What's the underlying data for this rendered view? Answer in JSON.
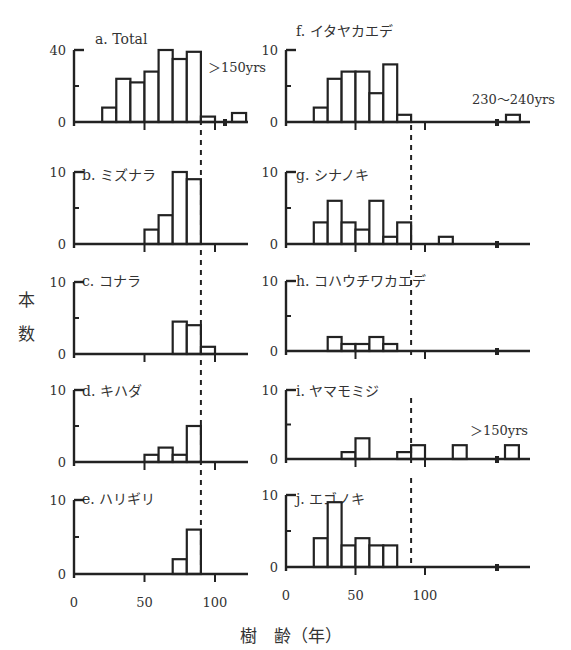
{
  "chart_data": {
    "type": "bar",
    "xlabel": "樹 齢（年）",
    "ylabel": "本 数",
    "bin_width": 10,
    "x_ticks": [
      0,
      50,
      100
    ],
    "reference_line": {
      "x": 90,
      "style": "dashed"
    },
    "panels": [
      {
        "id": "a",
        "title": "a. Total",
        "ylim": [
          0,
          40
        ],
        "yticks": [
          "0",
          "40"
        ],
        "column": "left",
        "bins": [
          [
            20,
            8
          ],
          [
            30,
            24
          ],
          [
            40,
            22
          ],
          [
            50,
            28
          ],
          [
            60,
            40
          ],
          [
            70,
            35
          ],
          [
            80,
            39
          ],
          [
            90,
            3
          ]
        ],
        "break": true,
        "tail_label": "＞150yrs",
        "tail_bins": [
          [
            150,
            5
          ]
        ]
      },
      {
        "id": "b",
        "title": "b. ミズナラ",
        "ylim": [
          0,
          10
        ],
        "yticks": [
          "0",
          "10"
        ],
        "column": "left",
        "bins": [
          [
            50,
            2
          ],
          [
            60,
            4
          ],
          [
            70,
            10
          ],
          [
            80,
            9
          ]
        ]
      },
      {
        "id": "c",
        "title": "c. コナラ",
        "ylim": [
          0,
          10
        ],
        "yticks": [
          "0",
          "10"
        ],
        "column": "left",
        "bins": [
          [
            70,
            4.5
          ],
          [
            80,
            4
          ],
          [
            90,
            1
          ]
        ]
      },
      {
        "id": "d",
        "title": "d. キハダ",
        "ylim": [
          0,
          10
        ],
        "yticks": [
          "0",
          "10"
        ],
        "column": "left",
        "bins": [
          [
            50,
            1
          ],
          [
            60,
            2
          ],
          [
            70,
            1
          ],
          [
            80,
            5
          ]
        ]
      },
      {
        "id": "e",
        "title": "e. ハリギリ",
        "ylim": [
          0,
          10
        ],
        "yticks": [
          "0",
          "10"
        ],
        "column": "left",
        "bins": [
          [
            70,
            2
          ],
          [
            80,
            6
          ]
        ]
      },
      {
        "id": "f",
        "title": "f. イタヤカエデ",
        "ylim": [
          0,
          10
        ],
        "yticks": [
          "0",
          "10"
        ],
        "column": "right",
        "bins": [
          [
            20,
            2
          ],
          [
            30,
            6
          ],
          [
            40,
            7
          ],
          [
            50,
            7
          ],
          [
            60,
            4
          ],
          [
            70,
            8
          ],
          [
            80,
            1
          ]
        ],
        "break": true,
        "tail_label": "230〜240yrs",
        "tail_bins": [
          [
            230,
            1
          ]
        ]
      },
      {
        "id": "g",
        "title": "g. シナノキ",
        "ylim": [
          0,
          10
        ],
        "yticks": [
          "0",
          "10"
        ],
        "column": "right",
        "bins": [
          [
            20,
            3
          ],
          [
            30,
            6
          ],
          [
            40,
            3
          ],
          [
            50,
            2
          ],
          [
            60,
            6
          ],
          [
            70,
            1
          ],
          [
            80,
            3
          ],
          [
            110,
            1
          ]
        ],
        "break": true
      },
      {
        "id": "h",
        "title": "h. コハウチワカエデ",
        "ylim": [
          0,
          10
        ],
        "yticks": [
          "0",
          "10"
        ],
        "column": "right",
        "bins": [
          [
            30,
            2
          ],
          [
            40,
            1
          ],
          [
            50,
            1
          ],
          [
            60,
            2
          ],
          [
            70,
            1
          ]
        ],
        "break": true
      },
      {
        "id": "i",
        "title": "i. ヤマモミジ",
        "ylim": [
          0,
          10
        ],
        "yticks": [
          "0",
          "10"
        ],
        "column": "right",
        "bins": [
          [
            40,
            1
          ],
          [
            50,
            3
          ],
          [
            80,
            1
          ],
          [
            90,
            2
          ],
          [
            120,
            2
          ]
        ],
        "break": true,
        "tail_label": "＞150yrs",
        "tail_bins": [
          [
            150,
            2
          ]
        ]
      },
      {
        "id": "j",
        "title": "j. エゴノキ",
        "ylim": [
          0,
          10
        ],
        "yticks": [
          "0",
          "10"
        ],
        "column": "right",
        "bins": [
          [
            20,
            4
          ],
          [
            30,
            9
          ],
          [
            40,
            3
          ],
          [
            50,
            4
          ],
          [
            60,
            3
          ],
          [
            70,
            3
          ]
        ],
        "break": true
      }
    ]
  },
  "labels": {
    "y_axis_char1": "本",
    "y_axis_char2": "数",
    "x_axis_label": "樹　齢（年）",
    "x_tick_0": "0",
    "x_tick_50": "50",
    "x_tick_100": "100"
  }
}
